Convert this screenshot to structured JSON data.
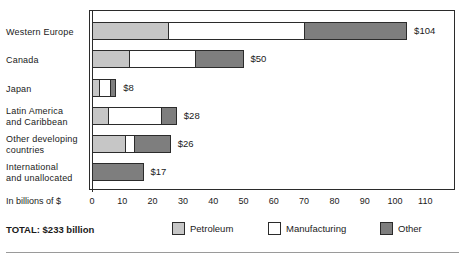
{
  "chart_data": {
    "type": "bar",
    "orientation": "horizontal",
    "stacked": true,
    "title": "",
    "xlabel": "In billions of $",
    "ylabel": "",
    "xlim": [
      0,
      115
    ],
    "grid": false,
    "legend_position": "bottom",
    "categories": [
      "Western Europe",
      "Canada",
      "Japan",
      "Latin America\nand Caribbean",
      "Other developing\ncountries",
      "International\nand unallocated"
    ],
    "tick_labels": [
      "0",
      "10",
      "20",
      "30",
      "40",
      "50",
      "60",
      "70",
      "80",
      "90",
      "100",
      "110"
    ],
    "tick_values": [
      0,
      10,
      20,
      30,
      40,
      50,
      60,
      70,
      80,
      90,
      100,
      110
    ],
    "series": [
      {
        "name": "Petroleum",
        "color": "#c6c6c6",
        "values": [
          25,
          12,
          2,
          5,
          11,
          0
        ]
      },
      {
        "name": "Manufacturing",
        "color": "#ffffff",
        "values": [
          45,
          22,
          4,
          18,
          3,
          0
        ]
      },
      {
        "name": "Other",
        "color": "#7e7e7e",
        "values": [
          34,
          16,
          2,
          5,
          12,
          17
        ]
      }
    ],
    "totals": [
      104,
      50,
      8,
      28,
      26,
      17
    ],
    "value_labels": [
      "$104",
      "$50",
      "$8",
      "$28",
      "$26",
      "$17"
    ],
    "total_label": "TOTAL: $233 billion",
    "total_value": 233
  },
  "legend": {
    "items": [
      {
        "label": "Petroleum",
        "color": "#c6c6c6"
      },
      {
        "label": "Manufacturing",
        "color": "#ffffff"
      },
      {
        "label": "Other",
        "color": "#7e7e7e"
      }
    ]
  }
}
